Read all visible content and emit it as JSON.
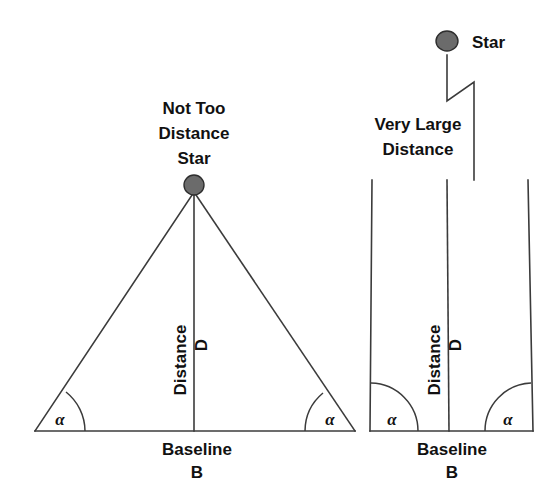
{
  "figure": {
    "background_color": "#ffffff",
    "line_color": "#3b3b3b",
    "text_color": "#111111",
    "star_fill_color": "#6b6b6b",
    "star_outline_color": "#2e2e2e"
  },
  "panels": [
    {
      "id": "near-star",
      "position": "left",
      "star_label_lines": [
        "Not Too",
        "Distance",
        "Star"
      ],
      "star_label": "Not Too Distance Star",
      "distance_label": "Distance",
      "distance_symbol": "D",
      "baseline_label": "Baseline",
      "baseline_symbol": "B",
      "angle_symbol_left": "α",
      "angle_symbol_right": "α",
      "geometry": {
        "apex_x": 194,
        "apex_y": 192,
        "base_left_x": 35,
        "base_right_x": 355,
        "base_y": 431,
        "star_center_x": 194,
        "star_center_y": 185,
        "star_radius": 10
      }
    },
    {
      "id": "far-star",
      "position": "right",
      "star_label_lines": [
        "Star"
      ],
      "star_label": "Star",
      "distance_caption_lines": [
        "Very Large",
        "Distance"
      ],
      "distance_caption": "Very Large Distance",
      "distance_label": "Distance",
      "distance_symbol": "D",
      "baseline_label": "Baseline",
      "baseline_symbol": "B",
      "angle_symbol_left": "α",
      "angle_symbol_right": "α",
      "geometry": {
        "star_center_x": 447,
        "star_center_y": 41,
        "star_radius": 11,
        "break_top_y": 55,
        "break_bottom_y": 101,
        "break_offset_x": 474,
        "left_top_x": 372,
        "left_bottom_x": 370,
        "mid_top_x": 447,
        "mid_bottom_x": 449,
        "right_top_x": 528,
        "right_bottom_x": 533,
        "top_y": 180,
        "base_y": 431
      }
    }
  ]
}
